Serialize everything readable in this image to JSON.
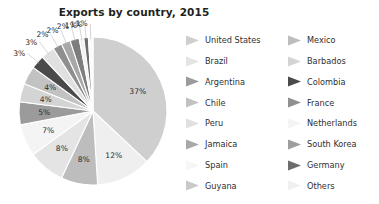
{
  "chart_data": {
    "type": "pie",
    "title": "Exports by country, 2015",
    "xlabel": "",
    "ylabel": "",
    "legend_position": "right",
    "grid": false,
    "categories": [
      "United States",
      "Others",
      "Mexico",
      "Brazil",
      "Netherlands",
      "Argentina",
      "Barbados",
      "Chile",
      "Colombia",
      "Peru",
      "France",
      "Jamaica",
      "South Korea",
      "Spain",
      "Germany",
      "Guyana"
    ],
    "values": [
      37,
      12,
      8,
      8,
      7,
      5,
      4,
      4,
      3,
      3,
      2,
      2,
      2,
      1,
      1,
      1
    ],
    "value_labels": [
      "37%",
      "12%",
      "8%",
      "8%",
      "7%",
      "5%",
      "4%",
      "4%",
      "3%",
      "3%",
      "2%",
      "2%",
      "2%",
      "1%",
      "1%",
      "1%"
    ],
    "colors": [
      "#cfcfcf",
      "#efefef",
      "#bdbdbd",
      "#e4e4e4",
      "#f4f4f4",
      "#9b9b9b",
      "#d4d4d4",
      "#c2c2c2",
      "#4a4a4a",
      "#e0e0e0",
      "#8f8f8f",
      "#a8a8a8",
      "#7d7d7d",
      "#f2f2f2",
      "#6d6d6d",
      "#fbfbfb"
    ],
    "unit": "%"
  },
  "legend": {
    "columns": [
      {
        "items": [
          {
            "label": "United States",
            "color": "#cfcfcf"
          },
          {
            "label": "Brazil",
            "color": "#e4e4e4"
          },
          {
            "label": "Argentina",
            "color": "#9b9b9b"
          },
          {
            "label": "Chile",
            "color": "#c2c2c2"
          },
          {
            "label": "Peru",
            "color": "#e0e0e0"
          },
          {
            "label": "Jamaica",
            "color": "#a8a8a8"
          },
          {
            "label": "Spain",
            "color": "#f2f2f2"
          },
          {
            "label": "Guyana",
            "color": "#c9c9c9"
          }
        ]
      },
      {
        "items": [
          {
            "label": "Mexico",
            "color": "#bdbdbd"
          },
          {
            "label": "Barbados",
            "color": "#d4d4d4"
          },
          {
            "label": "Colombia",
            "color": "#4a4a4a"
          },
          {
            "label": "France",
            "color": "#8f8f8f"
          },
          {
            "label": "Netherlands",
            "color": "#f4f4f4"
          },
          {
            "label": "South Korea",
            "color": "#9e9e9e"
          },
          {
            "label": "Germany",
            "color": "#6d6d6d"
          },
          {
            "label": "Others",
            "color": "#efefef"
          }
        ]
      }
    ]
  }
}
